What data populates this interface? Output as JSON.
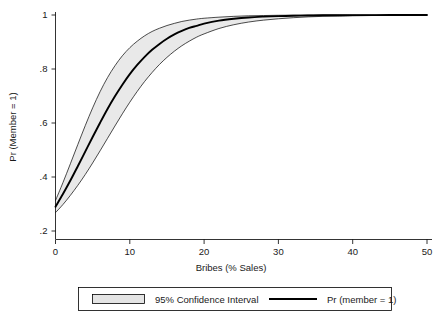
{
  "chart_data": {
    "type": "line",
    "title": "",
    "subtitle": "",
    "xlabel": "Bribes (% Sales)",
    "ylabel": "Pr (Member = 1)",
    "xlim": [
      0,
      50
    ],
    "ylim": [
      0.2,
      1.0
    ],
    "grid": false,
    "legend_position": "bottom",
    "xticks": [
      0,
      10,
      20,
      30,
      40,
      50
    ],
    "xtick_labels": [
      "0",
      "10",
      "20",
      "30",
      "40",
      "50"
    ],
    "yticks": [
      0.2,
      0.4,
      0.6,
      0.8,
      1.0
    ],
    "ytick_labels": [
      ".2",
      ".4",
      ".6",
      ".8",
      "1"
    ],
    "x": [
      0,
      1,
      2,
      3,
      4,
      5,
      6,
      7,
      8,
      9,
      10,
      11,
      12,
      13,
      14,
      15,
      16,
      17,
      18,
      19,
      20,
      22,
      24,
      26,
      28,
      30,
      32,
      34,
      36,
      38,
      40,
      45,
      50
    ],
    "series": [
      {
        "name": "Pr (member = 1)",
        "kind": "line",
        "color": "#000000",
        "values": [
          0.29,
          0.337,
          0.387,
          0.44,
          0.494,
          0.548,
          0.601,
          0.652,
          0.699,
          0.742,
          0.781,
          0.815,
          0.845,
          0.871,
          0.893,
          0.912,
          0.928,
          0.941,
          0.952,
          0.96,
          0.968,
          0.979,
          0.986,
          0.991,
          0.994,
          0.996,
          0.997,
          0.998,
          0.999,
          0.999,
          0.9995,
          0.9998,
          1.0
        ]
      },
      {
        "name": "95% Confidence Interval upper",
        "kind": "band-upper",
        "color": "#e9e9e9",
        "values": [
          0.313,
          0.379,
          0.449,
          0.52,
          0.59,
          0.656,
          0.716,
          0.768,
          0.812,
          0.849,
          0.879,
          0.903,
          0.923,
          0.939,
          0.951,
          0.961,
          0.969,
          0.976,
          0.981,
          0.985,
          0.988,
          0.992,
          0.995,
          0.997,
          0.998,
          0.999,
          0.9993,
          0.9996,
          0.9998,
          0.9999,
          1.0,
          1.0,
          1.0
        ]
      },
      {
        "name": "95% Confidence Interval lower",
        "kind": "band-lower",
        "color": "#e9e9e9",
        "values": [
          0.268,
          0.298,
          0.332,
          0.369,
          0.409,
          0.452,
          0.497,
          0.543,
          0.589,
          0.634,
          0.677,
          0.717,
          0.754,
          0.787,
          0.817,
          0.843,
          0.866,
          0.886,
          0.903,
          0.918,
          0.93,
          0.95,
          0.964,
          0.974,
          0.981,
          0.986,
          0.99,
          0.993,
          0.995,
          0.996,
          0.997,
          0.999,
          1.0
        ]
      }
    ],
    "legend": [
      {
        "label": "95% Confidence Interval",
        "marker": "swatch",
        "color": "#e4e4e4"
      },
      {
        "label": "Pr (member = 1)",
        "marker": "line",
        "color": "#000000"
      }
    ]
  }
}
